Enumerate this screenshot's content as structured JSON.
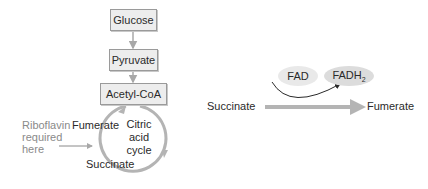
{
  "left_panel": {
    "pathway_boxes": [
      {
        "label": "Glucose"
      },
      {
        "label": "Pyruvate"
      },
      {
        "label": "Acetyl-CoA"
      }
    ],
    "cycle": {
      "label_line1": "Citric",
      "label_line2": "acid",
      "label_line3": "cycle",
      "fumerate_label": "Fumerate",
      "succinate_label": "Succinate"
    },
    "annotation": {
      "line1": "Riboflavin",
      "line2": "required",
      "line3": "here"
    }
  },
  "right_panel": {
    "cofactor_in": "FAD",
    "cofactor_out_base": "FADH",
    "cofactor_out_sub": "2",
    "substrate": "Succinate",
    "product": "Fumerate"
  },
  "colors": {
    "box_fill": "#ededed",
    "box_border": "#9a9a9a",
    "arrow_gray": "#b4b4b4",
    "text_dark": "#2a2a2a",
    "text_gray": "#8a8a8a"
  }
}
